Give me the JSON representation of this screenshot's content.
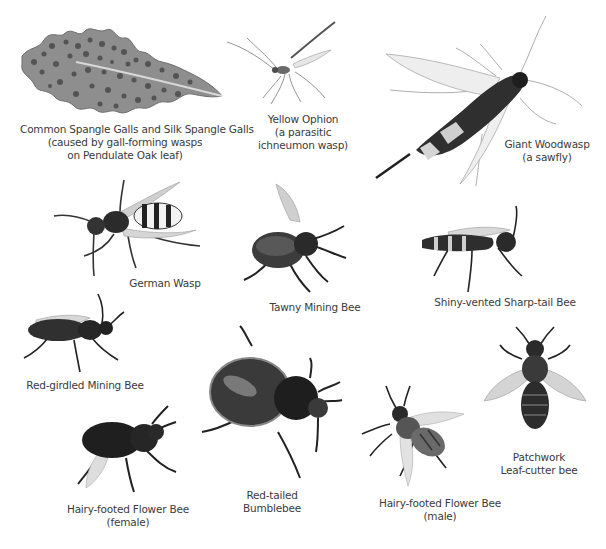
{
  "plate": {
    "background": "#ffffff",
    "text_color": "#3b3b3b",
    "specimens": [
      {
        "id": "spangle-galls",
        "lines": [
          "Common Spangle Galls and Silk Spangle Galls",
          "(caused by gall-forming wasps",
          "on Pendulate Oak leaf)"
        ]
      },
      {
        "id": "yellow-ophion",
        "lines": [
          "Yellow Ophion",
          "(a parasitic",
          "ichneumon wasp)"
        ]
      },
      {
        "id": "giant-woodwasp",
        "lines": [
          "Giant Woodwasp",
          "(a sawfly)"
        ]
      },
      {
        "id": "german-wasp",
        "lines": [
          "German Wasp"
        ]
      },
      {
        "id": "tawny-mining-bee",
        "lines": [
          "Tawny Mining Bee"
        ]
      },
      {
        "id": "shiny-vented-sharp-tail-bee",
        "lines": [
          "Shiny-vented Sharp-tail Bee"
        ]
      },
      {
        "id": "red-girdled-mining-bee",
        "lines": [
          "Red-girdled Mining Bee"
        ]
      },
      {
        "id": "red-tailed-bumblebee",
        "lines": [
          "Red-tailed",
          "Bumblebee"
        ]
      },
      {
        "id": "patchwork-leaf-cutter-bee",
        "lines": [
          "Patchwork",
          "Leaf-cutter bee"
        ]
      },
      {
        "id": "hairy-footed-flower-bee-female",
        "lines": [
          "Hairy-footed Flower Bee",
          "(female)"
        ]
      },
      {
        "id": "hairy-footed-flower-bee-male",
        "lines": [
          "Hairy-footed Flower Bee",
          "(male)"
        ]
      }
    ]
  }
}
